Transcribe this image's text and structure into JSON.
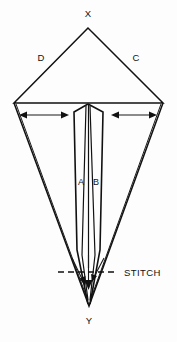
{
  "figure": {
    "type": "line-diagram",
    "background_color": "#fdfdfd",
    "line_color": "#111111",
    "width": 177,
    "height": 342
  },
  "labels": {
    "apex_top": "X",
    "apex_bottom": "Y",
    "side_left": "D",
    "side_right": "C",
    "panel_left": "A",
    "panel_right": "B",
    "stitch": "STITCH"
  },
  "annotations": {
    "stitch_line_style": "dashed",
    "arrow_left_label": "",
    "arrow_right_label": "",
    "arrow_style": "double-headed"
  },
  "geometry": {
    "top_apex": [
      88,
      28
    ],
    "left_shoulder": [
      14,
      103
    ],
    "right_shoulder": [
      163,
      103
    ],
    "bottom_tip": [
      89,
      306
    ],
    "panel_peak": [
      88,
      103
    ],
    "panel_left_top": [
      74,
      110
    ],
    "panel_right_top": [
      103,
      110
    ],
    "panel_left_bottom": [
      79,
      258
    ],
    "panel_right_bottom": [
      99,
      258
    ],
    "stitch_y": 272
  }
}
